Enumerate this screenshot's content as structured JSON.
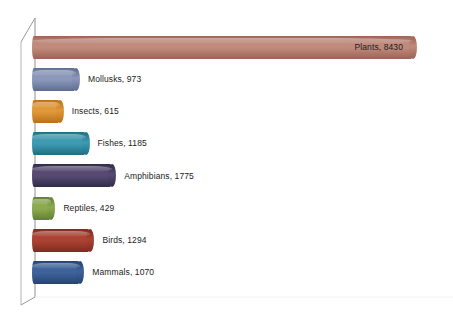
{
  "chart_data": {
    "type": "bar",
    "orientation": "horizontal",
    "style": "3d-cylinder",
    "title": "",
    "subtitle": "",
    "xlabel": "",
    "ylabel": "",
    "categories": [
      "Plants",
      "Mollusks",
      "Insects",
      "Fishes",
      "Amphibians",
      "Reptiles",
      "Birds",
      "Mammals"
    ],
    "values": [
      8430,
      973,
      615,
      1185,
      1775,
      429,
      1294,
      1070
    ],
    "labels": [
      "Plants, 8430",
      "Mollusks, 973",
      "Insects, 615",
      "Fishes, 1185",
      "Amphibians, 1775",
      "Reptiles, 429",
      "Birds, 1294",
      "Mammals, 1070"
    ],
    "xlim": [
      0,
      8430
    ],
    "grid": false,
    "legend": false,
    "data_labels": true,
    "data_label_format": "category, value",
    "colors": [
      "#b5786a",
      "#7b88ac",
      "#d98a2b",
      "#2f88a0",
      "#4b3d63",
      "#7d9b43",
      "#9c3b2c",
      "#35588c"
    ],
    "axis_color": "#9a9a9a"
  },
  "bars": [
    {
      "name": "plants",
      "label": "Plants, 8430",
      "value": 8430,
      "color_mid": "#c08a7c",
      "color_edge": "#9c6255",
      "label_placement": "inside"
    },
    {
      "name": "mollusks",
      "label": "Mollusks, 973",
      "value": 973,
      "color_mid": "#8b98bb",
      "color_edge": "#5e6c92",
      "label_placement": "outside"
    },
    {
      "name": "insects",
      "label": "Insects, 615",
      "value": 615,
      "color_mid": "#e09838",
      "color_edge": "#b7711a",
      "label_placement": "outside"
    },
    {
      "name": "fishes",
      "label": "Fishes, 1185",
      "value": 1185,
      "color_mid": "#3e9bb2",
      "color_edge": "#1f6d83",
      "label_placement": "outside"
    },
    {
      "name": "amphibians",
      "label": "Amphibians, 1775",
      "value": 1775,
      "color_mid": "#564a72",
      "color_edge": "#332a48",
      "label_placement": "outside"
    },
    {
      "name": "reptiles",
      "label": "Reptiles, 429",
      "value": 429,
      "color_mid": "#8cab4f",
      "color_edge": "#627f31",
      "label_placement": "outside"
    },
    {
      "name": "birds",
      "label": "Birds, 1294",
      "value": 1294,
      "color_mid": "#ab4233",
      "color_edge": "#7d2c1f",
      "label_placement": "outside"
    },
    {
      "name": "mammals",
      "label": "Mammals, 1070",
      "value": 1070,
      "color_mid": "#3e639b",
      "color_edge": "#26436f",
      "label_placement": "outside"
    }
  ]
}
